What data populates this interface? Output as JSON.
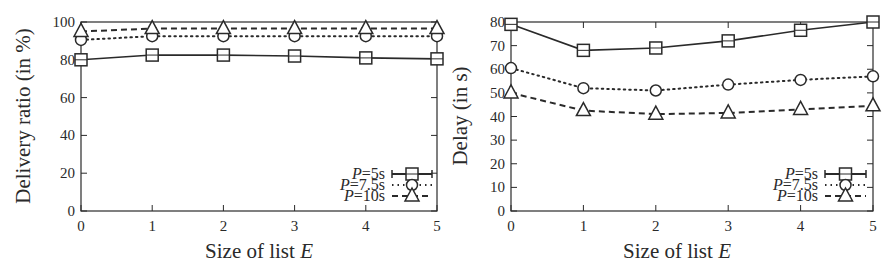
{
  "chart_data": [
    {
      "type": "line",
      "title": "",
      "xlabel": "Size of list E",
      "ylabel": "Delivery ratio (in %)",
      "x": [
        0,
        1,
        2,
        3,
        4,
        5
      ],
      "xticks": [
        "0",
        "1",
        "2",
        "3",
        "4",
        "5"
      ],
      "yticks": [
        "0",
        "20",
        "40",
        "60",
        "80",
        "100"
      ],
      "xlim": [
        0,
        5
      ],
      "ylim": [
        0,
        100
      ],
      "grid": false,
      "legend_position": "lower right",
      "series": [
        {
          "name": "P=5s",
          "marker": "square",
          "line": "solid",
          "values": [
            80,
            82.5,
            82.5,
            82,
            81,
            80.5
          ]
        },
        {
          "name": "P=7.5s",
          "marker": "circle",
          "line": "dotted",
          "values": [
            90.5,
            92.5,
            92.5,
            92.5,
            92.5,
            92.5
          ]
        },
        {
          "name": "P=10s",
          "marker": "triangle",
          "line": "dashed",
          "values": [
            95,
            96.5,
            96.5,
            96.5,
            96.5,
            96.5
          ]
        }
      ]
    },
    {
      "type": "line",
      "title": "",
      "xlabel": "Size of list E",
      "ylabel": "Delay (in s)",
      "x": [
        0,
        1,
        2,
        3,
        4,
        5
      ],
      "xticks": [
        "0",
        "1",
        "2",
        "3",
        "4",
        "5"
      ],
      "yticks": [
        "0",
        "10",
        "20",
        "30",
        "40",
        "50",
        "60",
        "70",
        "80"
      ],
      "xlim": [
        0,
        5
      ],
      "ylim": [
        0,
        80
      ],
      "grid": false,
      "legend_position": "lower right",
      "series": [
        {
          "name": "P=5s",
          "marker": "square",
          "line": "solid",
          "values": [
            79,
            68,
            69,
            72,
            76.5,
            80
          ]
        },
        {
          "name": "P=7.5s",
          "marker": "circle",
          "line": "dotted",
          "values": [
            60.5,
            52,
            51,
            53.5,
            55.5,
            57
          ]
        },
        {
          "name": "P=10s",
          "marker": "triangle",
          "line": "dashed",
          "values": [
            50,
            42.5,
            41,
            41.5,
            43,
            44.5
          ]
        }
      ]
    }
  ],
  "left_chart": {
    "ylabel": "Delivery ratio (in %)",
    "xlabel_prefix": "Size of list ",
    "xlabel_var": "E",
    "legend": [
      "=5s",
      "=7.5s",
      "=10s"
    ],
    "legend_var": "P"
  },
  "right_chart": {
    "ylabel": "Delay (in s)",
    "xlabel_prefix": "Size of list ",
    "xlabel_var": "E",
    "legend": [
      "=5s",
      "=7.5s",
      "=10s"
    ],
    "legend_var": "P"
  },
  "colors": {
    "ink": "#2a2a2a",
    "background": "#ffffff"
  }
}
